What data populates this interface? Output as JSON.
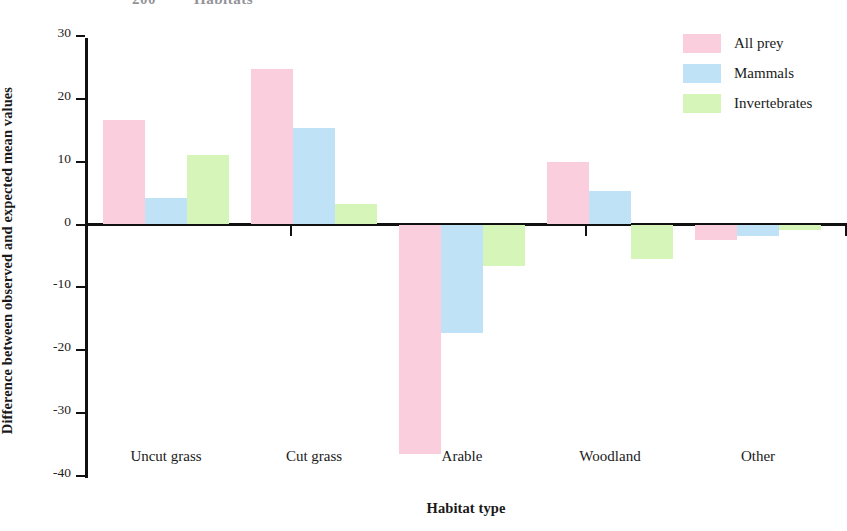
{
  "top_clipped_text": {
    "number": "200",
    "word": "Habitats"
  },
  "chart_data": {
    "type": "bar",
    "title": "",
    "xlabel": "Habitat type",
    "ylabel": "Difference between observed and expected mean values",
    "categories": [
      "Uncut grass",
      "Cut grass",
      "Arable",
      "Woodland",
      "Other"
    ],
    "series": [
      {
        "name": "All prey",
        "color": "#fbcede",
        "values": [
          16.7,
          24.7,
          -36.5,
          10.0,
          -2.5
        ]
      },
      {
        "name": "Mammals",
        "color": "#bfe2f7",
        "values": [
          4.2,
          15.3,
          -17.3,
          5.4,
          -1.8
        ]
      },
      {
        "name": "Invertebrates",
        "color": "#d6f5b9",
        "values": [
          11.0,
          3.2,
          -6.6,
          -5.5,
          -0.8
        ]
      }
    ],
    "ylim": [
      -40,
      30
    ],
    "yticks": [
      30,
      20,
      10,
      0,
      -10,
      -20,
      -30,
      -40
    ],
    "ytick_labels": [
      "30",
      "20",
      "10",
      "0",
      "-10",
      "-20",
      "-30",
      "-40"
    ],
    "grid": false,
    "legend_position": "top-right",
    "zero_line": true
  }
}
